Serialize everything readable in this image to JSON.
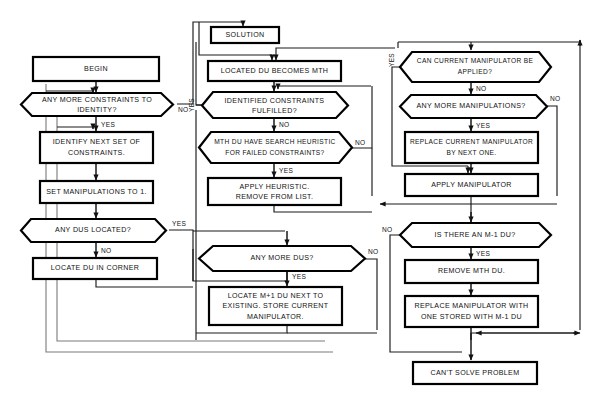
{
  "diagram": {
    "kind": "flowchart",
    "colors": {
      "node_stroke": "#000000",
      "node_fill": "#ffffff",
      "connector": "#1a1a1a",
      "frame": "#7a7a7a",
      "background": "#ffffff"
    }
  },
  "nodes": {
    "solution": {
      "label": "SOLUTION",
      "shape": "terminator"
    },
    "begin": {
      "label": "BEGIN",
      "shape": "terminator"
    },
    "any_more_constraints": {
      "line1": "ANY MORE CONSTRAINTS TO",
      "line2": "IDENTITY?",
      "shape": "decision"
    },
    "identify_next_set": {
      "line1": "IDENTIFY NEXT SET OF",
      "line2": "CONSTRAINTS.",
      "shape": "process"
    },
    "set_manipulations": {
      "label": "SET MANIPULATIONS TO 1.",
      "shape": "process"
    },
    "any_dus_located": {
      "label": "ANY DUS LOCATED?",
      "shape": "decision"
    },
    "locate_du_corner": {
      "label": "LOCATE DU IN CORNER",
      "shape": "process"
    },
    "located_du_becomes_mth": {
      "label": "LOCATED DU BECOMES MTH",
      "shape": "process"
    },
    "identified_constraints_fulfilled": {
      "line1": "IDENTIFIED CONSTRAINTS",
      "line2": "FULFILLED?",
      "shape": "decision"
    },
    "mth_du_search_heuristic": {
      "line1": "MTH DU HAVE SEARCH HEURISTIC",
      "line2": "FOR FAILED CONSTRAINTS?",
      "shape": "decision"
    },
    "apply_heuristic": {
      "line1": "APPLY HEURISTIC.",
      "line2": "REMOVE FROM LIST.",
      "shape": "process"
    },
    "any_more_dus": {
      "label": "ANY MORE DUS?",
      "shape": "decision"
    },
    "locate_m_plus_1": {
      "line1": "LOCATE M+1 DU NEXT TO",
      "line2": "EXISTING. STORE CURRENT",
      "line3": "MANIPULATOR.",
      "shape": "process"
    },
    "can_current_manipulator": {
      "line1": "CAN CURRENT MANIPULATOR BE",
      "line2": "APPLIED?",
      "shape": "decision"
    },
    "any_more_manipulations": {
      "label": "ANY MORE MANIPULATIONS?",
      "shape": "decision"
    },
    "replace_current_manipulator": {
      "line1": "REPLACE CURRENT MANIPULATOR",
      "line2": "BY NEXT ONE.",
      "shape": "process"
    },
    "apply_manipulator": {
      "label": "APPLY MANIPULATOR",
      "shape": "process"
    },
    "is_there_m_minus_1": {
      "label": "IS THERE AN M-1 DU?",
      "shape": "decision"
    },
    "remove_mth_du": {
      "label": "REMOVE MTH DU.",
      "shape": "process"
    },
    "replace_manipulator_with": {
      "line1": "REPLACE MANIPULATOR WITH",
      "line2": "ONE STORED WITH M-1 DU",
      "shape": "process"
    },
    "cant_solve": {
      "label": "CAN'T SOLVE PROBLEM",
      "shape": "terminator"
    }
  },
  "edge_labels": {
    "constraints_no": "NO",
    "constraints_yes": "YES",
    "dus_located_yes": "YES",
    "dus_located_no": "NO",
    "fulfilled_yes": "YES",
    "fulfilled_no": "NO",
    "heuristic_yes": "YES",
    "heuristic_no": "NO",
    "more_dus_yes": "YES",
    "more_dus_no": "NO",
    "can_manip_yes": "YES",
    "can_manip_no": "NO",
    "more_manip_yes": "YES",
    "more_manip_no": "NO",
    "m1_du_yes": "YES",
    "m1_du_no": "NO"
  }
}
